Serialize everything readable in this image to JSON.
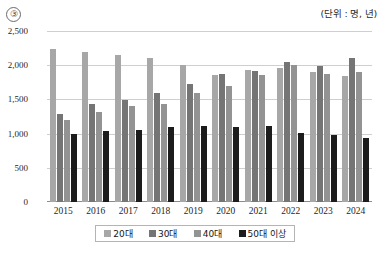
{
  "header": {
    "item_number": "③",
    "unit_note": "(단위 : 명, 년)"
  },
  "chart_data": {
    "type": "bar",
    "title": "",
    "subtitle": "",
    "xlabel": "",
    "ylabel": "",
    "unit_note": "(단위 : 명, 년)",
    "categories": [
      "2015",
      "2016",
      "2017",
      "2018",
      "2019",
      "2020",
      "2021",
      "2022",
      "2023",
      "2024"
    ],
    "ylim": [
      0,
      2500
    ],
    "yticks": [
      "0",
      "500",
      "1,000",
      "1,500",
      "2,000",
      "2,500"
    ],
    "ytick_values": [
      0,
      500,
      1000,
      1500,
      2000,
      2500
    ],
    "grid": true,
    "legend_position": "bottom",
    "series": [
      {
        "name": "20대",
        "color": "#a7a7a7",
        "values": [
          2230,
          2200,
          2150,
          2100,
          2000,
          1850,
          1930,
          1960,
          1900,
          1840
        ]
      },
      {
        "name": "30대",
        "color": "#757575",
        "values": [
          1290,
          1430,
          1490,
          1600,
          1720,
          1870,
          1910,
          2050,
          1990,
          2100
        ]
      },
      {
        "name": "40대",
        "color": "#939393",
        "values": [
          1200,
          1310,
          1400,
          1440,
          1590,
          1700,
          1860,
          2010,
          1870,
          1900
        ]
      },
      {
        "name": "50대 이상",
        "color": "#1c1c1c",
        "values": [
          990,
          1040,
          1060,
          1090,
          1110,
          1090,
          1110,
          1010,
          980,
          940
        ]
      }
    ]
  }
}
